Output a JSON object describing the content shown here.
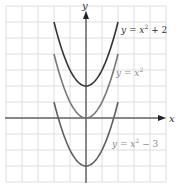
{
  "chart_data": {
    "type": "line",
    "title": "",
    "xlabel": "x",
    "ylabel": "y",
    "xlim": [
      -5,
      5
    ],
    "ylim": [
      -4,
      7
    ],
    "grid": true,
    "tick_labels": false,
    "series": [
      {
        "name": "y = x^2 + 2",
        "label_text": "y = x² + 2",
        "color": "#333333",
        "x": [
          -2,
          -1.5,
          -1,
          -0.5,
          0,
          0.5,
          1,
          1.5,
          2
        ],
        "values": [
          6,
          4.25,
          3,
          2.25,
          2,
          2.25,
          3,
          4.25,
          6
        ]
      },
      {
        "name": "y = x^2",
        "label_text": "y = x²",
        "color": "#777777",
        "x": [
          -2,
          -1.5,
          -1,
          -0.5,
          0,
          0.5,
          1,
          1.5,
          2
        ],
        "values": [
          4,
          2.25,
          1,
          0.25,
          0,
          0.25,
          1,
          2.25,
          4
        ]
      },
      {
        "name": "y = x^2 - 3",
        "label_text": "y = x² − 3",
        "color": "#5e5e5e",
        "x": [
          -2,
          -1.5,
          -1,
          -0.5,
          0,
          0.5,
          1,
          1.5,
          2
        ],
        "values": [
          1,
          -0.75,
          -2,
          -2.75,
          -3,
          -2.75,
          -2,
          -0.75,
          1
        ]
      }
    ]
  },
  "labels": {
    "x_axis": "x",
    "y_axis": "y",
    "top_curve": {
      "pre": "y = ",
      "var": "x",
      "exp": "2",
      "post": " + 2",
      "color": "#333333"
    },
    "mid_curve": {
      "pre": "y = ",
      "var": "x",
      "exp": "2",
      "post": "",
      "color": "#8a8a8a"
    },
    "bot_curve": {
      "pre": "y = ",
      "var": "x",
      "exp": "2",
      "post": " − 3",
      "color": "#8a8a8a"
    }
  }
}
